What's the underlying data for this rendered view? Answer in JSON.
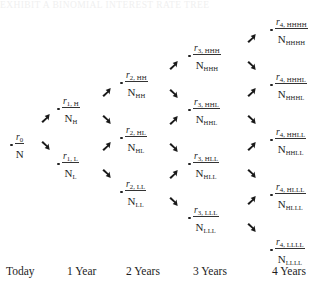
{
  "figure": {
    "kind": "binomial-interest-rate-tree",
    "top_cut_caption": "EXHIBIT  A  BINOMIAL  INTEREST  RATE  TREE",
    "node_numerator_symbol": "r",
    "node_denominator_symbol": "N",
    "fraction_bar": true,
    "bullet_glyph": "dot",
    "arrow_up_icon": "arrow-up-right-icon",
    "arrow_down_icon": "arrow-down-right-icon",
    "text_color": "#1d1d1d",
    "background_color": "#ffffff"
  },
  "axis": {
    "labels": [
      {
        "label": "Today",
        "x": 6
      },
      {
        "label": "1 Year",
        "x": 67
      },
      {
        "label": "2 Years",
        "x": 126
      },
      {
        "label": "3 Years",
        "x": 193
      },
      {
        "label": "4 Years",
        "x": 272
      }
    ]
  },
  "columns": [
    {
      "period": 0,
      "name": "today",
      "nodes": [
        {
          "id": "n0",
          "num": "r",
          "num_sub": "0",
          "den": "N",
          "den_sub": "",
          "x": 10,
          "y": 127
        }
      ]
    },
    {
      "period": 1,
      "name": "1-year",
      "nodes": [
        {
          "id": "n1H",
          "num": "r",
          "num_sub": "1, H",
          "den": "N",
          "den_sub": "H",
          "x": 57,
          "y": 91
        },
        {
          "id": "n1L",
          "num": "r",
          "num_sub": "1, L",
          "den": "N",
          "den_sub": "L",
          "x": 57,
          "y": 146
        }
      ]
    },
    {
      "period": 2,
      "name": "2-years",
      "nodes": [
        {
          "id": "n2HH",
          "num": "r",
          "num_sub": "2, HH",
          "den": "N",
          "den_sub": "HH",
          "x": 120,
          "y": 65
        },
        {
          "id": "n2HL",
          "num": "r",
          "num_sub": "2, HL",
          "den": "N",
          "den_sub": "HL",
          "x": 120,
          "y": 120
        },
        {
          "id": "n2LL",
          "num": "r",
          "num_sub": "2, LL",
          "den": "N",
          "den_sub": "LL",
          "x": 120,
          "y": 174
        }
      ]
    },
    {
      "period": 3,
      "name": "3-years",
      "nodes": [
        {
          "id": "n3HHH",
          "num": "r",
          "num_sub": "3, HHH",
          "den": "N",
          "den_sub": "HHH",
          "x": 188,
          "y": 38
        },
        {
          "id": "n3HHL",
          "num": "r",
          "num_sub": "3, HHL",
          "den": "N",
          "den_sub": "HHL",
          "x": 188,
          "y": 92
        },
        {
          "id": "n3HLL",
          "num": "r",
          "num_sub": "3, HLL",
          "den": "N",
          "den_sub": "HLL",
          "x": 188,
          "y": 146
        },
        {
          "id": "n3LLL",
          "num": "r",
          "num_sub": "3, LLL",
          "den": "N",
          "den_sub": "LLL",
          "x": 188,
          "y": 200
        }
      ]
    },
    {
      "period": 4,
      "name": "4-years",
      "nodes": [
        {
          "id": "n4HHHH",
          "num": "r",
          "num_sub": "4, HHHH",
          "den": "N",
          "den_sub": "HHHH",
          "x": 270,
          "y": 12
        },
        {
          "id": "n4HHHL",
          "num": "r",
          "num_sub": "4, HHHL",
          "den": "N",
          "den_sub": "HHHL",
          "x": 270,
          "y": 67
        },
        {
          "id": "n4HHLL",
          "num": "r",
          "num_sub": "4, HHLL",
          "den": "N",
          "den_sub": "HHLL",
          "x": 270,
          "y": 122
        },
        {
          "id": "n4HLLL",
          "num": "r",
          "num_sub": "4, HLLL",
          "den": "N",
          "den_sub": "HLLL",
          "x": 270,
          "y": 177
        },
        {
          "id": "n4LLLL",
          "num": "r",
          "num_sub": "4, LLLL",
          "den": "N",
          "den_sub": "LLLL",
          "x": 270,
          "y": 232
        }
      ]
    }
  ],
  "arrows": [
    {
      "dir": "up",
      "from": "n0",
      "to": "n1H",
      "x": 40,
      "y": 113
    },
    {
      "dir": "down",
      "from": "n0",
      "to": "n1L",
      "x": 40,
      "y": 140
    },
    {
      "dir": "up",
      "from": "n1H",
      "to": "n2HH",
      "x": 101,
      "y": 87
    },
    {
      "dir": "down",
      "from": "n1H",
      "to": "n2HL",
      "x": 101,
      "y": 114
    },
    {
      "dir": "up",
      "from": "n1L",
      "to": "n2HL",
      "x": 101,
      "y": 141
    },
    {
      "dir": "down",
      "from": "n1L",
      "to": "n2LL",
      "x": 101,
      "y": 168
    },
    {
      "dir": "up",
      "from": "n2HH",
      "to": "n3HHH",
      "x": 168,
      "y": 60
    },
    {
      "dir": "down",
      "from": "n2HH",
      "to": "n3HHL",
      "x": 168,
      "y": 88
    },
    {
      "dir": "up",
      "from": "n2HL",
      "to": "n3HHL",
      "x": 168,
      "y": 115
    },
    {
      "dir": "down",
      "from": "n2HL",
      "to": "n3HLL",
      "x": 168,
      "y": 142
    },
    {
      "dir": "up",
      "from": "n2LL",
      "to": "n3HLL",
      "x": 168,
      "y": 169
    },
    {
      "dir": "down",
      "from": "n2LL",
      "to": "n3LLL",
      "x": 168,
      "y": 196
    },
    {
      "dir": "up",
      "from": "n3HHH",
      "to": "n4HHHH",
      "x": 246,
      "y": 33
    },
    {
      "dir": "down",
      "from": "n3HHH",
      "to": "n4HHHL",
      "x": 246,
      "y": 60
    },
    {
      "dir": "up",
      "from": "n3HHL",
      "to": "n4HHHL",
      "x": 246,
      "y": 87
    },
    {
      "dir": "down",
      "from": "n3HHL",
      "to": "n4HHLL",
      "x": 246,
      "y": 114
    },
    {
      "dir": "up",
      "from": "n3HLL",
      "to": "n4HHLL",
      "x": 246,
      "y": 141
    },
    {
      "dir": "down",
      "from": "n3HLL",
      "to": "n4HLLL",
      "x": 246,
      "y": 168
    },
    {
      "dir": "up",
      "from": "n3LLL",
      "to": "n4HLLL",
      "x": 246,
      "y": 195
    },
    {
      "dir": "down",
      "from": "n3LLL",
      "to": "n4LLLL",
      "x": 246,
      "y": 222
    }
  ]
}
